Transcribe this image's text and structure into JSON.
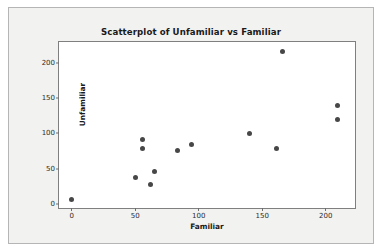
{
  "figure": {
    "background_color": "#f2f2f1",
    "plot_background_color": "#ffffff",
    "border_color": "#b5b5b5",
    "frame_color": "#7f7f7f",
    "marker_color": "#474747"
  },
  "chart_data": {
    "type": "scatter",
    "title": "Scatterplot of Unfamiliar vs Familiar",
    "xlabel": "Familiar",
    "ylabel": "Unfamiliar",
    "xlim": [
      -10,
      223
    ],
    "ylim": [
      -6,
      230
    ],
    "xticks": [
      0,
      50,
      100,
      150,
      200
    ],
    "xticklabels": [
      "0",
      "50",
      "100",
      "150",
      "200"
    ],
    "yticks": [
      0,
      50,
      100,
      150,
      200
    ],
    "yticklabels": [
      "0",
      "50",
      "100",
      "150",
      "200"
    ],
    "grid": false,
    "legend": null,
    "series": [
      {
        "name": "Unfamiliar vs Familiar",
        "marker": "filled-circle",
        "color": "#474747",
        "points": [
          {
            "x": 0,
            "y": 6
          },
          {
            "x": 50,
            "y": 38
          },
          {
            "x": 56,
            "y": 92
          },
          {
            "x": 56,
            "y": 78
          },
          {
            "x": 62,
            "y": 27
          },
          {
            "x": 65,
            "y": 46
          },
          {
            "x": 83,
            "y": 76
          },
          {
            "x": 94,
            "y": 84
          },
          {
            "x": 140,
            "y": 100
          },
          {
            "x": 161,
            "y": 78
          },
          {
            "x": 166,
            "y": 216
          },
          {
            "x": 209,
            "y": 140
          },
          {
            "x": 209,
            "y": 120
          }
        ]
      }
    ]
  }
}
